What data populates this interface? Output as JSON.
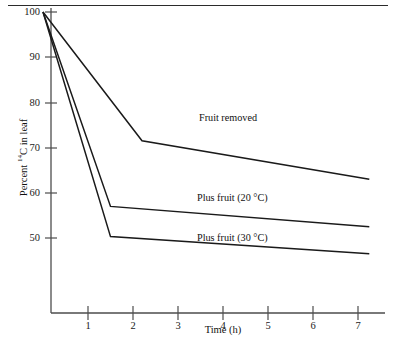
{
  "chart_data": {
    "type": "line",
    "title": "",
    "xlabel": "Time (h)",
    "ylabel": "Percent 14C in leaf",
    "ylabel_prefix": "Percent ",
    "ylabel_sup": "14",
    "ylabel_suffix": "C in leaf",
    "xlim": [
      0,
      7.6
    ],
    "ylim": [
      44.5,
      100
    ],
    "xticks": [
      1,
      2,
      3,
      4,
      5,
      6,
      7
    ],
    "yticks": [
      50,
      60,
      70,
      80,
      90,
      100
    ],
    "grid": false,
    "legend_position": "inline-annotations",
    "series": [
      {
        "name": "Fruit removed",
        "label": "Fruit removed",
        "color": "#1a1a1a",
        "x": [
          0,
          2.2,
          7.25
        ],
        "values": [
          100,
          71.5,
          63
        ]
      },
      {
        "name": "Plus fruit (20 C)",
        "label": "Plus fruit (20 °C)",
        "color": "#1a1a1a",
        "x": [
          0,
          1.5,
          7.25
        ],
        "values": [
          100,
          57,
          52.5
        ]
      },
      {
        "name": "Plus fruit (30 C)",
        "label": "Plus fruit (30 °C)",
        "color": "#1a1a1a",
        "x": [
          0,
          1.5,
          7.25
        ],
        "values": [
          100,
          50.3,
          46.5
        ]
      }
    ]
  },
  "axis": {
    "y_tick_labels": [
      "100",
      "90",
      "80",
      "70",
      "60",
      "50"
    ],
    "x_tick_labels": [
      "1",
      "2",
      "3",
      "4",
      "5",
      "6",
      "7"
    ],
    "x_title": "Time (h)"
  },
  "annotations": {
    "fruit_removed": "Fruit removed",
    "plus_fruit_20": "Plus fruit (20 °C)",
    "plus_fruit_30": "Plus fruit (30 °C)"
  },
  "colors": {
    "line": "#1a1a1a",
    "axis": "#4d4d4d",
    "rule": "#2b2b2b",
    "background": "#ffffff"
  }
}
